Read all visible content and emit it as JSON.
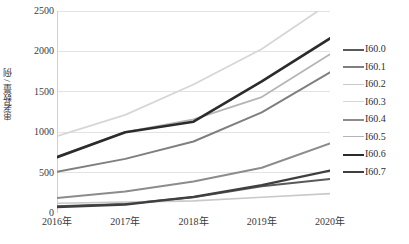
{
  "chart_data": {
    "type": "line",
    "title": "",
    "xlabel": "",
    "ylabel": "患者数量 / 例",
    "categories": [
      "2016年",
      "2017年",
      "2018年",
      "2019年",
      "2020年"
    ],
    "ylim": [
      0,
      2500
    ],
    "yticks": [
      0,
      500,
      1000,
      1500,
      2000,
      2500
    ],
    "ytick_labels": [
      "0",
      "500",
      "1000",
      "1500",
      "2000",
      "2500"
    ],
    "grid": true,
    "legend_position": "right",
    "series": [
      {
        "name": "I60.0",
        "values": [
          85,
          110,
          195,
          330,
          420
        ],
        "color": "#595959",
        "width": 2.0
      },
      {
        "name": "I60.1",
        "values": [
          510,
          670,
          885,
          1245,
          1740
        ],
        "color": "#7f7f7f",
        "width": 2.0
      },
      {
        "name": "I60.2",
        "values": [
          120,
          135,
          150,
          195,
          240
        ],
        "color": "#c9c9c9",
        "width": 1.6
      },
      {
        "name": "I60.3",
        "values": [
          950,
          1215,
          1590,
          2030,
          2600
        ],
        "color": "#d6d6d6",
        "width": 1.8
      },
      {
        "name": "I60.4",
        "values": [
          185,
          265,
          390,
          560,
          860
        ],
        "color": "#8c8c8c",
        "width": 2.0
      },
      {
        "name": "I60.5",
        "values": [
          700,
          1000,
          1160,
          1435,
          1965
        ],
        "color": "#b5b5b5",
        "width": 1.8
      },
      {
        "name": "I60.6",
        "values": [
          690,
          1000,
          1130,
          1630,
          2160
        ],
        "color": "#2b2b2b",
        "width": 2.6
      },
      {
        "name": "I60.7",
        "values": [
          75,
          105,
          200,
          345,
          525
        ],
        "color": "#3f3f3f",
        "width": 2.4
      }
    ]
  },
  "legend": {
    "items": [
      {
        "label": "I60.0"
      },
      {
        "label": "I60.1"
      },
      {
        "label": "I60.2"
      },
      {
        "label": "I60.3"
      },
      {
        "label": "I60.4"
      },
      {
        "label": "I60.5"
      },
      {
        "label": "I60.6"
      },
      {
        "label": "I60.7"
      }
    ]
  },
  "style": {
    "gridline_color": "#e3e3e3",
    "axis_color": "#d0d0d0",
    "text_color": "#3a3a3a",
    "background": "#ffffff"
  }
}
